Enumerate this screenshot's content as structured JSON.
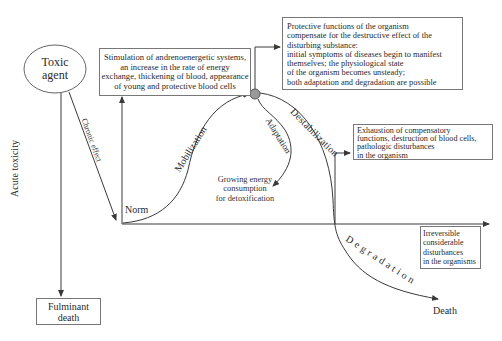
{
  "toxic_agent": {
    "line1": "Toxic",
    "line2": "agent"
  },
  "stimulation_box": {
    "lines": [
      "Stimulation of andrenoenergetic systems,",
      "an increase in the rate of energy",
      "exchange, thickening of blood, appearance",
      "of young and protective blood cells"
    ]
  },
  "protective_box": {
    "lines": [
      "Protective functions of the organism",
      "compensate for the destructive effect of the",
      "disturbing substance:",
      "initial symptoms of diseases begin to manifest",
      "themselves; the physiological state",
      "of the organism becomes unsteady;",
      "both adaptation and degradation are possible"
    ]
  },
  "exhaustion_box": {
    "lines": [
      "Exhaustion of compensatory",
      "functions, destruction of blood cells,",
      "pathologic disturbances",
      "in the organism"
    ]
  },
  "irreversible_box": {
    "lines": [
      "Irreversible",
      "considerable",
      "disturbances",
      "in the organisms"
    ]
  },
  "fulminant_box": {
    "line1": "Fulminant",
    "line2": "death"
  },
  "labels": {
    "chronic_effect": "Chronic effect",
    "acute_toxicity": "Acute toxicity",
    "mobilization": "Mobilization",
    "adaptation": "Adaptation",
    "destabilization": "Destabilization",
    "degradation": "Degradation",
    "norm": "Norm",
    "death": "Death",
    "energy_line1": "Growing energy",
    "energy_line2": "consumption",
    "energy_line3": "for detoxification"
  },
  "colors": {
    "line": "#3a3a3a",
    "node_fill": "#9a9a9a"
  }
}
